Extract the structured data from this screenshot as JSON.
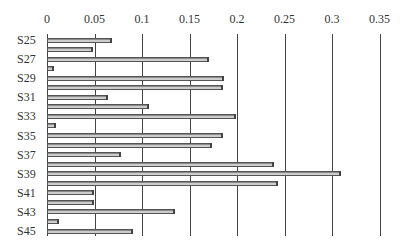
{
  "chart_data": {
    "type": "bar",
    "orientation": "horizontal",
    "title": "",
    "xlabel": "",
    "ylabel": "",
    "xlim": [
      0,
      0.35
    ],
    "x_ticks": [
      "0",
      "0.05",
      "0.1",
      "0.15",
      "0.2",
      "0.25",
      "0.3",
      "0.35"
    ],
    "x_axis_position": "top",
    "grid": true,
    "legend": null,
    "categories": [
      "S25",
      "S26",
      "S27",
      "S28",
      "S29",
      "S30",
      "S31",
      "S32",
      "S33",
      "S34",
      "S35",
      "S36",
      "S37",
      "S38",
      "S39",
      "S40",
      "S41",
      "S42",
      "S43",
      "S44",
      "S45"
    ],
    "visible_category_labels": [
      "S25",
      "S27",
      "S29",
      "S31",
      "S33",
      "S35",
      "S37",
      "S39",
      "S41",
      "S43",
      "S45"
    ],
    "values": [
      0.067,
      0.047,
      0.169,
      0.006,
      0.185,
      0.184,
      0.063,
      0.106,
      0.198,
      0.008,
      0.184,
      0.173,
      0.077,
      0.238,
      0.308,
      0.242,
      0.048,
      0.048,
      0.134,
      0.012,
      0.089
    ]
  }
}
